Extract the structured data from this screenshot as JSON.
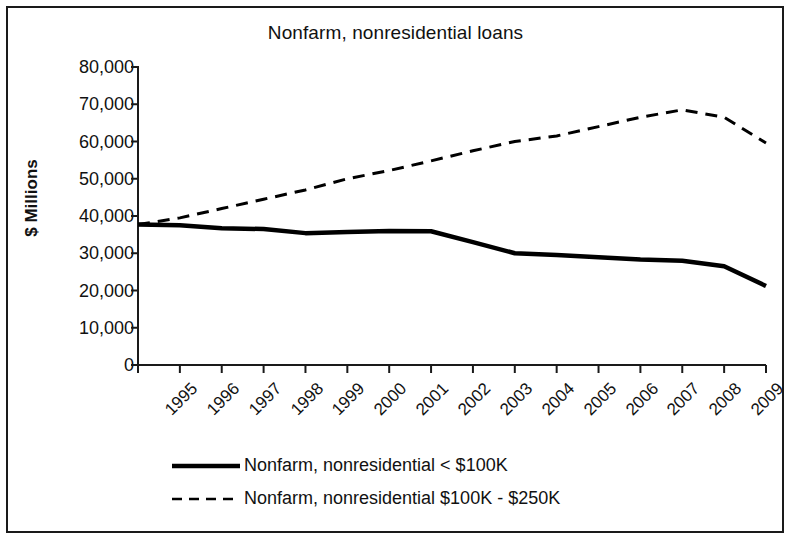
{
  "chart_data": {
    "type": "line",
    "title": "Nonfarm, nonresidential loans",
    "xlabel": "",
    "ylabel": "$ Millions",
    "ylim": [
      0,
      80000
    ],
    "ytick_labels": [
      "80,000",
      "70,000",
      "60,000",
      "50,000",
      "40,000",
      "30,000",
      "20,000",
      "10,000",
      "0"
    ],
    "ytick_values": [
      80000,
      70000,
      60000,
      50000,
      40000,
      30000,
      20000,
      10000,
      0
    ],
    "grid": false,
    "legend_position": "bottom",
    "categories": [
      "1995",
      "1996",
      "1997",
      "1998",
      "1999",
      "2000",
      "2001",
      "2002",
      "2003",
      "2004",
      "2005",
      "2006",
      "2007",
      "2008",
      "2009",
      "9/30/2010"
    ],
    "series": [
      {
        "name": "Nonfarm, nonresidential < $100K",
        "style": "solid",
        "color": "#000000",
        "values": [
          37700,
          37500,
          36700,
          36500,
          35400,
          35700,
          36000,
          35900,
          33000,
          30000,
          29500,
          28900,
          28300,
          28000,
          26500,
          21200
        ]
      },
      {
        "name": "Nonfarm, nonresidential $100K - $250K",
        "style": "dashed",
        "color": "#000000",
        "values": [
          37700,
          39500,
          42000,
          44500,
          47000,
          50000,
          52200,
          54800,
          57500,
          60000,
          61500,
          64000,
          66500,
          68500,
          66500,
          59600
        ]
      }
    ]
  },
  "legend": {
    "items": [
      {
        "label": "Nonfarm, nonresidential < $100K",
        "style": "solid"
      },
      {
        "label": "Nonfarm, nonresidential $100K - $250K",
        "style": "dashed"
      }
    ]
  }
}
